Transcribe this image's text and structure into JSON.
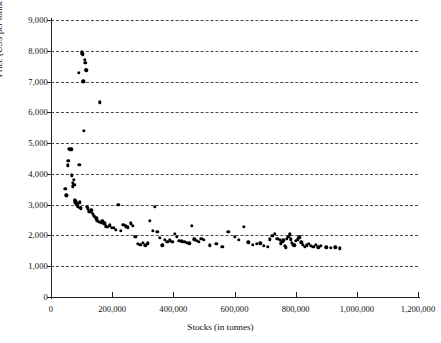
{
  "chart": {
    "type": "scatter",
    "title": "",
    "xlabel": "Stocks (in tonnes)",
    "ylabel": "Price (US$ per tonne)",
    "xlim": [
      0,
      1200000
    ],
    "ylim": [
      0,
      9000
    ],
    "grid": true,
    "legend": null,
    "x_ticks": [
      "0",
      "200,000",
      "400,000",
      "600,000",
      "800,000",
      "1,000,000",
      "1,200,000"
    ],
    "x_tick_values": [
      0,
      200000,
      400000,
      600000,
      800000,
      1000000,
      1200000
    ],
    "y_ticks": [
      "0",
      "1,000",
      "2,000",
      "3,000",
      "4,000",
      "5,000",
      "6,000",
      "7,000",
      "8,000",
      "9,000"
    ],
    "y_tick_values": [
      0,
      1000,
      2000,
      3000,
      4000,
      5000,
      6000,
      7000,
      8000,
      9000
    ],
    "marker": {
      "shape": "circle",
      "color": "#000000",
      "size": 3.4
    }
  },
  "chart_data": {
    "type": "scatter",
    "title": "",
    "xlabel": "Stocks (in tonnes)",
    "ylabel": "Price (US$ per tonne)",
    "xlim": [
      0,
      1200000
    ],
    "ylim": [
      0,
      9000
    ],
    "grid": true,
    "series": [
      {
        "name": "Stocks vs Price",
        "points": [
          [
            47000,
            3520
          ],
          [
            50000,
            3300
          ],
          [
            52000,
            3280
          ],
          [
            55000,
            4280
          ],
          [
            57000,
            4420
          ],
          [
            60000,
            4820
          ],
          [
            62000,
            4790
          ],
          [
            66000,
            4800
          ],
          [
            69000,
            3950
          ],
          [
            71000,
            3720
          ],
          [
            72000,
            3600
          ],
          [
            74000,
            3810
          ],
          [
            76000,
            3640
          ],
          [
            78000,
            3150
          ],
          [
            79000,
            3120
          ],
          [
            80000,
            3080
          ],
          [
            81000,
            3060
          ],
          [
            82000,
            3100
          ],
          [
            83000,
            3040
          ],
          [
            84000,
            3000
          ],
          [
            85000,
            2990
          ],
          [
            86000,
            3020
          ],
          [
            87000,
            2960
          ],
          [
            88000,
            2930
          ],
          [
            90000,
            7280
          ],
          [
            92000,
            4300
          ],
          [
            94000,
            3080
          ],
          [
            96000,
            2900
          ],
          [
            98000,
            2880
          ],
          [
            100000,
            7950
          ],
          [
            102000,
            7900
          ],
          [
            104000,
            7880
          ],
          [
            105000,
            7000
          ],
          [
            106000,
            7010
          ],
          [
            108000,
            5400
          ],
          [
            110000,
            7700
          ],
          [
            112000,
            7600
          ],
          [
            114000,
            7390
          ],
          [
            116000,
            7360
          ],
          [
            118000,
            2940
          ],
          [
            120000,
            2880
          ],
          [
            124000,
            2780
          ],
          [
            128000,
            2760
          ],
          [
            132000,
            2820
          ],
          [
            136000,
            2700
          ],
          [
            140000,
            2640
          ],
          [
            144000,
            2600
          ],
          [
            148000,
            2560
          ],
          [
            152000,
            2480
          ],
          [
            156000,
            2440
          ],
          [
            160000,
            6330
          ],
          [
            164000,
            2420
          ],
          [
            168000,
            2460
          ],
          [
            172000,
            2400
          ],
          [
            176000,
            2390
          ],
          [
            180000,
            2300
          ],
          [
            186000,
            2280
          ],
          [
            192000,
            2330
          ],
          [
            198000,
            2240
          ],
          [
            205000,
            2250
          ],
          [
            212000,
            2180
          ],
          [
            220000,
            2990
          ],
          [
            228000,
            2160
          ],
          [
            236000,
            2340
          ],
          [
            244000,
            2300
          ],
          [
            252000,
            2260
          ],
          [
            260000,
            2400
          ],
          [
            268000,
            2320
          ],
          [
            276000,
            1960
          ],
          [
            284000,
            1720
          ],
          [
            292000,
            1700
          ],
          [
            300000,
            1760
          ],
          [
            308000,
            1680
          ],
          [
            316000,
            1740
          ],
          [
            324000,
            2480
          ],
          [
            332000,
            2160
          ],
          [
            340000,
            2940
          ],
          [
            348000,
            2110
          ],
          [
            356000,
            1930
          ],
          [
            364000,
            1680
          ],
          [
            372000,
            1860
          ],
          [
            380000,
            1800
          ],
          [
            388000,
            1840
          ],
          [
            396000,
            1790
          ],
          [
            404000,
            2060
          ],
          [
            412000,
            1960
          ],
          [
            420000,
            1830
          ],
          [
            428000,
            1810
          ],
          [
            436000,
            1800
          ],
          [
            444000,
            1770
          ],
          [
            452000,
            1750
          ],
          [
            460000,
            2320
          ],
          [
            468000,
            1880
          ],
          [
            476000,
            1820
          ],
          [
            484000,
            1790
          ],
          [
            492000,
            1900
          ],
          [
            500000,
            1860
          ],
          [
            520000,
            1680
          ],
          [
            540000,
            1720
          ],
          [
            560000,
            1640
          ],
          [
            580000,
            2120
          ],
          [
            600000,
            1960
          ],
          [
            615000,
            1860
          ],
          [
            630000,
            2280
          ],
          [
            645000,
            1780
          ],
          [
            660000,
            1700
          ],
          [
            672000,
            1720
          ],
          [
            684000,
            1750
          ],
          [
            696000,
            1660
          ],
          [
            708000,
            1640
          ],
          [
            716000,
            1880
          ],
          [
            724000,
            1980
          ],
          [
            732000,
            2060
          ],
          [
            740000,
            1900
          ],
          [
            748000,
            1860
          ],
          [
            752000,
            1740
          ],
          [
            756000,
            1800
          ],
          [
            760000,
            1840
          ],
          [
            764000,
            1660
          ],
          [
            768000,
            1620
          ],
          [
            772000,
            1900
          ],
          [
            776000,
            1950
          ],
          [
            780000,
            2040
          ],
          [
            784000,
            1880
          ],
          [
            788000,
            1760
          ],
          [
            792000,
            1700
          ],
          [
            796000,
            1680
          ],
          [
            800000,
            1820
          ],
          [
            806000,
            1870
          ],
          [
            812000,
            1940
          ],
          [
            818000,
            1780
          ],
          [
            824000,
            1700
          ],
          [
            830000,
            1640
          ],
          [
            836000,
            1680
          ],
          [
            842000,
            1720
          ],
          [
            850000,
            1660
          ],
          [
            858000,
            1640
          ],
          [
            866000,
            1700
          ],
          [
            874000,
            1620
          ],
          [
            882000,
            1660
          ],
          [
            900000,
            1620
          ],
          [
            915000,
            1600
          ],
          [
            930000,
            1620
          ],
          [
            945000,
            1580
          ]
        ]
      }
    ]
  }
}
